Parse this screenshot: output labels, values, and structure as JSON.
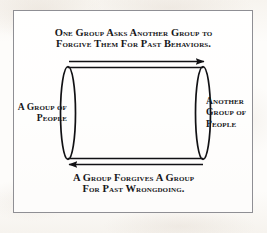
{
  "diagram": {
    "title_top_line1": "One Group Asks Another Group to",
    "title_top_line2": "Forgive Them For Past Behaviors.",
    "title_bottom_line1": "A Group Forgives A Group",
    "title_bottom_line2": "For Past Wrongdoing.",
    "label_left_line1": "A Group of",
    "label_left_line2": "People",
    "label_right_line1": "Another",
    "label_right_line2": "Group of",
    "label_right_line3": "People",
    "shapes": {
      "type": "cylinder-cycle",
      "left_node": "ellipse",
      "right_node": "ellipse",
      "top_arrow_direction": "right",
      "bottom_arrow_direction": "left"
    },
    "colors": {
      "ink": "#17171a",
      "stroke": "#111114",
      "frame": "#8f8f94",
      "paper": "#fdfcfa"
    }
  }
}
